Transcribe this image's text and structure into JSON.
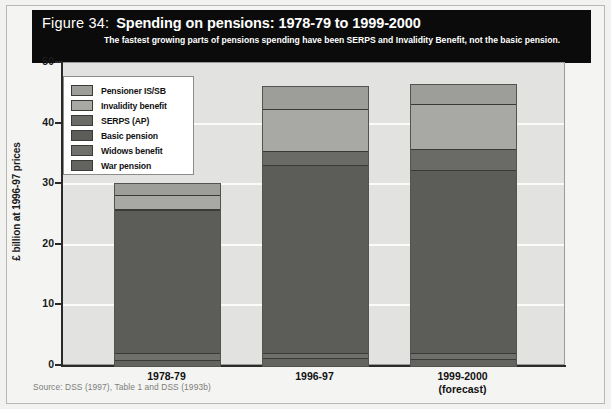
{
  "figure": {
    "number": "Figure 34:",
    "title": "Spending on pensions: 1978-79 to 1999-2000",
    "subtitle": "The fastest growing parts of pensions spending have been SERPS and Invalidity Benefit, not the basic pension.",
    "source": "Source: DSS (1997), Table 1 and DSS (1993b)"
  },
  "colors": {
    "banner_bg": "#0b0b0b",
    "banner_text": "#ffffff",
    "plot_bg": "#e2e2e0",
    "page_bg": "#f2f2f0",
    "gridline": "#fbfbfa",
    "axis": "#2a2a2a",
    "source_text": "#7d7d79",
    "pensioner_is_sb": "#9d9d99",
    "invalidity_benefit": "#a8a8a4",
    "serps_ap": "#6a6a66",
    "basic_pension": "#5c5c58",
    "widows_benefit": "#6f6f6b",
    "war_pension": "#63635f"
  },
  "chart_data": {
    "type": "bar",
    "stacked": true,
    "title": "Spending on pensions: 1978-79 to 1999-2000",
    "xlabel": "",
    "ylabel": "£ billion at 1996-97 prices",
    "ylim": [
      0,
      50
    ],
    "yticks": [
      0,
      10,
      20,
      30,
      40,
      50
    ],
    "ytick_labels": [
      "0",
      "10",
      "20",
      "30",
      "40",
      "50"
    ],
    "grid": true,
    "grid_axis": "y",
    "legend_position": "upper-left-inside",
    "categories": [
      "1978-79",
      "1996-97",
      "1999-2000\n(forecast)"
    ],
    "category_labels": [
      {
        "line1": "1978-79",
        "line2": ""
      },
      {
        "line1": "1996-97",
        "line2": ""
      },
      {
        "line1": "1999-2000",
        "line2": "(forecast)"
      }
    ],
    "series": [
      {
        "name": "War pension",
        "color": "#63635f",
        "values": [
          0.8,
          1.1,
          1.0
        ]
      },
      {
        "name": "Widows benefit",
        "color": "#6f6f6b",
        "values": [
          1.1,
          0.9,
          0.9
        ]
      },
      {
        "name": "Basic pension",
        "color": "#5c5c58",
        "values": [
          23.6,
          31.0,
          30.2
        ]
      },
      {
        "name": "SERPS (AP)",
        "color": "#6a6a66",
        "values": [
          0.3,
          2.3,
          3.6
        ]
      },
      {
        "name": "Invalidity benefit",
        "color": "#a8a8a4",
        "values": [
          2.2,
          7.0,
          7.4
        ]
      },
      {
        "name": "Pensioner IS/SB",
        "color": "#9d9d99",
        "values": [
          2.0,
          3.7,
          3.2
        ]
      }
    ],
    "totals": [
      30.0,
      46.0,
      46.3
    ],
    "legend_order": [
      "Pensioner IS/SB",
      "Invalidity benefit",
      "SERPS (AP)",
      "Basic pension",
      "Widows benefit",
      "War pension"
    ]
  }
}
